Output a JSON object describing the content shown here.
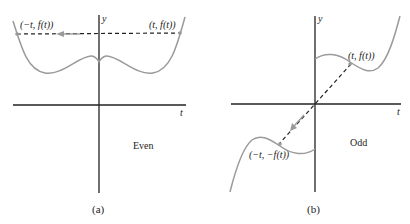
{
  "colors": {
    "axis": "#222222",
    "curve": "#9a9a9a",
    "dashed": "#222222",
    "arrow": "#9a9a9a",
    "text": "#222222"
  },
  "panel_a": {
    "caption": "(a)",
    "type_label": "Even",
    "y_axis_label": "y",
    "x_axis_label": "t",
    "point_right_label": "(t, f(t))",
    "point_left_label": "(−t, f(t))"
  },
  "panel_b": {
    "caption": "(b)",
    "type_label": "Odd",
    "y_axis_label": "y",
    "x_axis_label": "t",
    "point_upper_label": "(t, f(t))",
    "point_lower_label": "(−t, −f(t))"
  }
}
